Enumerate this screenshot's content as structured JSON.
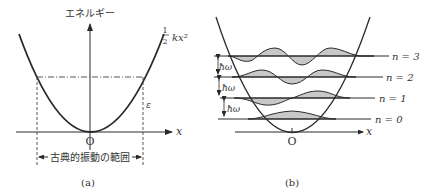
{
  "panel_a": {
    "caption": "(a)",
    "y_axis_label": "エネルギー",
    "x_axis_label": "x",
    "origin_label": "O",
    "potential_label_frac_num": "1",
    "potential_label_frac_den": "2",
    "potential_label_rest": "kx²",
    "energy_label": "ε",
    "range_label": "古典的振動の範囲"
  },
  "panel_b": {
    "caption": "(b)",
    "x_axis_label": "x",
    "origin_label": "O",
    "spacing_label": "ħω",
    "levels": [
      {
        "label": "n = 3"
      },
      {
        "label": "n = 2"
      },
      {
        "label": "n = 1"
      },
      {
        "label": "n = 0"
      }
    ]
  },
  "colors": {
    "ink": "#2a2a2a",
    "shade": "#c8c8c8"
  }
}
